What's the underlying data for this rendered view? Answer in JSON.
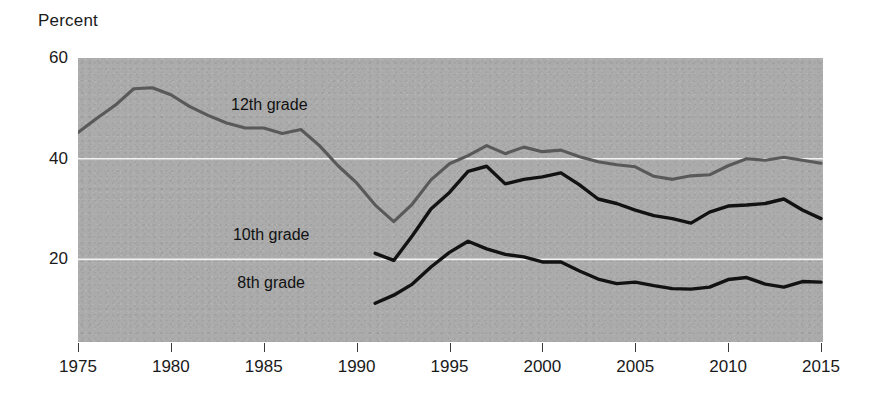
{
  "chart_data": {
    "type": "line",
    "title": "",
    "ylabel": "Percent",
    "xlabel": "",
    "ylim": [
      3.6,
      60
    ],
    "xlim": [
      1975,
      2015
    ],
    "yticks": [
      20,
      40,
      60
    ],
    "ytick_labels": [
      "20",
      "40",
      "60"
    ],
    "xticks": [
      1975,
      1980,
      1985,
      1990,
      1995,
      2000,
      2005,
      2010,
      2015
    ],
    "xtick_labels": [
      "1975",
      "1980",
      "1985",
      "1990",
      "1995",
      "2000",
      "2005",
      "2010",
      "2015"
    ],
    "grid": "horizontal-white-gridlines-at-20-and-40",
    "legend": "inline-series-labels",
    "plot_background": "#ababab",
    "series": [
      {
        "name": "12th grade",
        "color": "#595959",
        "label_x": 1985.3,
        "label_y": 50.6,
        "x": [
          1975,
          1976,
          1977,
          1978,
          1979,
          1980,
          1981,
          1982,
          1983,
          1984,
          1985,
          1986,
          1987,
          1988,
          1989,
          1990,
          1991,
          1992,
          1993,
          1994,
          1995,
          1996,
          1997,
          1998,
          1999,
          2000,
          2001,
          2002,
          2003,
          2004,
          2005,
          2006,
          2007,
          2008,
          2009,
          2010,
          2011,
          2012,
          2013,
          2014,
          2015
        ],
        "y": [
          45.2,
          48.0,
          50.6,
          53.9,
          54.1,
          52.7,
          50.4,
          48.6,
          47.1,
          46.1,
          46.1,
          45.0,
          45.8,
          42.6,
          38.6,
          35.2,
          30.8,
          27.5,
          31.0,
          35.8,
          39.0,
          40.6,
          42.6,
          41.0,
          42.3,
          41.4,
          41.7,
          40.4,
          39.4,
          38.8,
          38.4,
          36.5,
          35.9,
          36.6,
          36.8,
          38.6,
          40.0,
          39.7,
          40.3,
          39.7,
          39.1
        ]
      },
      {
        "name": "10th grade",
        "color": "#121212",
        "label_x": 1985.4,
        "label_y": 24.8,
        "x": [
          1991,
          1992,
          1993,
          1994,
          1995,
          1996,
          1997,
          1998,
          1999,
          2000,
          2001,
          2002,
          2003,
          2004,
          2005,
          2006,
          2007,
          2008,
          2009,
          2010,
          2011,
          2012,
          2013,
          2014,
          2015
        ],
        "y": [
          21.2,
          19.8,
          24.7,
          30.0,
          33.3,
          37.5,
          38.5,
          35.0,
          35.9,
          36.4,
          37.2,
          34.8,
          32.0,
          31.1,
          29.8,
          28.7,
          28.1,
          27.2,
          29.4,
          30.6,
          30.8,
          31.1,
          32.0,
          29.8,
          28.1
        ]
      },
      {
        "name": "8th grade",
        "color": "#121212",
        "label_x": 1985.4,
        "label_y": 15.3,
        "x": [
          1991,
          1992,
          1993,
          1994,
          1995,
          1996,
          1997,
          1998,
          1999,
          2000,
          2001,
          2002,
          2003,
          2004,
          2005,
          2006,
          2007,
          2008,
          2009,
          2010,
          2011,
          2012,
          2013,
          2014,
          2015
        ],
        "y": [
          11.3,
          12.9,
          15.1,
          18.5,
          21.4,
          23.6,
          22.1,
          21.0,
          20.5,
          19.5,
          19.5,
          17.7,
          16.1,
          15.2,
          15.5,
          14.8,
          14.2,
          14.1,
          14.5,
          16.0,
          16.4,
          15.1,
          14.5,
          15.6,
          15.5
        ]
      }
    ]
  }
}
